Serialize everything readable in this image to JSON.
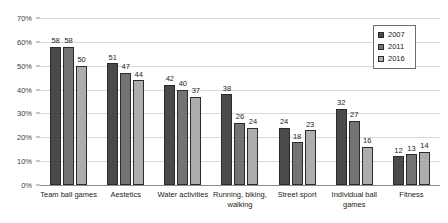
{
  "chart_data": {
    "type": "bar",
    "title": "",
    "subtitle": "",
    "xlabel": "",
    "ylabel": "",
    "ylim": [
      0,
      70
    ],
    "ytick_labels": [
      "0%",
      "10%",
      "20%",
      "30%",
      "40%",
      "50%",
      "60%",
      "70%"
    ],
    "ytick_values": [
      0,
      10,
      20,
      30,
      40,
      50,
      60,
      70
    ],
    "grid": true,
    "legend_position": "top-right",
    "categories": [
      "Team ball games",
      "Aestetics",
      "Water activities",
      "Running, biking, walking",
      "Street sport",
      "Individual ball games",
      "Fitness"
    ],
    "series": [
      {
        "name": "2007",
        "color": "#4a4a4a",
        "values": [
          58,
          51,
          42,
          38,
          24,
          32,
          12
        ]
      },
      {
        "name": "2011",
        "color": "#737373",
        "values": [
          58,
          47,
          40,
          26,
          18,
          27,
          13
        ]
      },
      {
        "name": "2016",
        "color": "#adadad",
        "values": [
          50,
          44,
          37,
          24,
          23,
          16,
          14
        ]
      }
    ]
  },
  "legend": {
    "items": [
      {
        "label": "2007",
        "series": 0
      },
      {
        "label": "2011",
        "series": 1
      },
      {
        "label": "2016",
        "series": 2
      }
    ]
  }
}
